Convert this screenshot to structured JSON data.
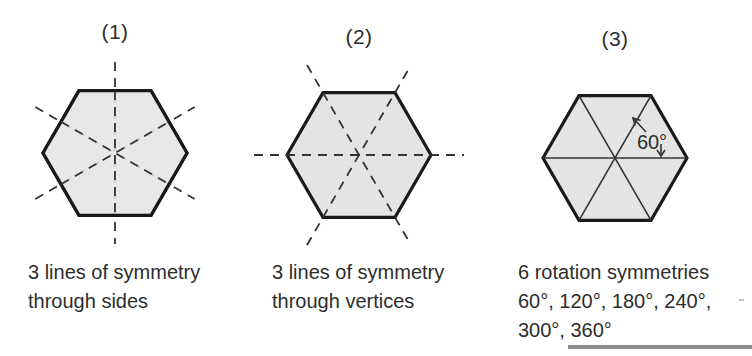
{
  "figures": [
    {
      "label": "(1)",
      "caption": [
        "3 lines of symmetry",
        "through sides"
      ]
    },
    {
      "label": "(2)",
      "caption": [
        "3 lines of symmetry",
        "through vertices"
      ]
    },
    {
      "label": "(3)",
      "angle_label": "60°",
      "caption": [
        "6 rotation symmetries",
        "60°, 120°, 180°, 240°,",
        "300°, 360°"
      ]
    }
  ],
  "colors": {
    "hexagon_fill": "#e4e4e4",
    "outline": "#1a1a1a",
    "line": "#333333",
    "text": "#2d2d2d",
    "divider": "#8d8d8d"
  }
}
